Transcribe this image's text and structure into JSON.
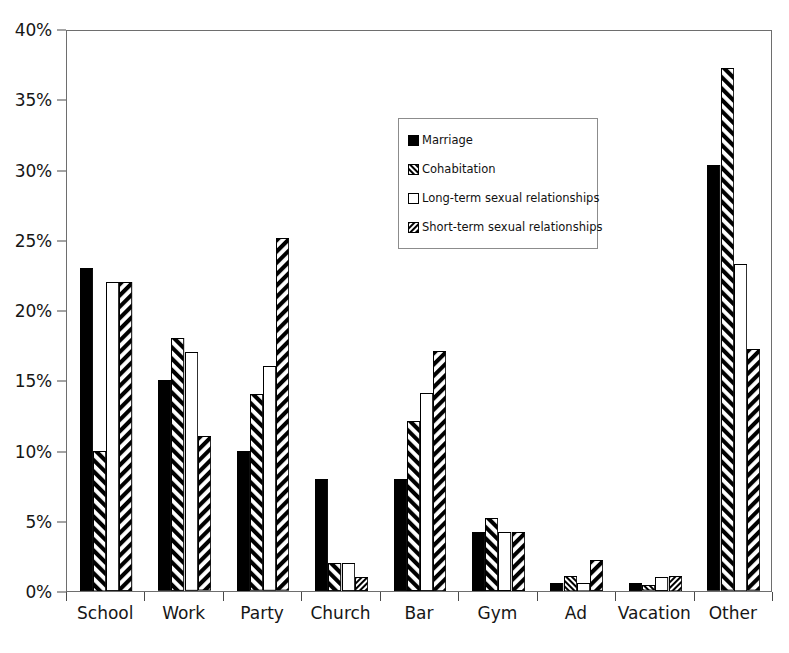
{
  "chart_data": {
    "type": "bar",
    "title": "",
    "subtitle": "",
    "xlabel": "",
    "ylabel": "",
    "ylim": [
      0,
      40
    ],
    "ytick_values": [
      0,
      5,
      10,
      15,
      20,
      25,
      30,
      35,
      40
    ],
    "ytick_labels": [
      "0%",
      "5%",
      "10%",
      "15%",
      "20%",
      "25%",
      "30%",
      "35%",
      "40%"
    ],
    "grid": false,
    "legend_position": "upper-center-right",
    "categories": [
      "School",
      "Work",
      "Party",
      "Church",
      "Bar",
      "Gym",
      "Ad",
      "Vacation",
      "Other"
    ],
    "series": [
      {
        "name": "Marriage",
        "fill": "solid-black",
        "color": "#000000",
        "values": [
          23,
          15,
          10,
          8,
          8,
          4.2,
          0.6,
          0.6,
          30.3
        ]
      },
      {
        "name": "Cohabitation",
        "fill": "hatch-forward",
        "color": "#000000",
        "values": [
          10,
          18,
          14,
          2,
          12.1,
          5.2,
          1.1,
          0.4,
          37.2
        ]
      },
      {
        "name": "Long-term sexual relationships",
        "fill": "empty-white",
        "color": "#ffffff",
        "values": [
          22,
          17,
          16,
          2,
          14.1,
          4.2,
          0.6,
          1,
          23.3
        ]
      },
      {
        "name": "Short-term sexual relationships",
        "fill": "hatch-backward",
        "color": "#000000",
        "values": [
          22,
          11,
          25.1,
          1,
          17.1,
          4.2,
          2.2,
          1.1,
          17.2
        ]
      }
    ]
  },
  "legend": {
    "items": [
      {
        "label": "Marriage",
        "swatch": "solid-black-swatch"
      },
      {
        "label": "Cohabitation",
        "swatch": "hatch-forward-swatch"
      },
      {
        "label": "Long-term sexual relationships",
        "swatch": "empty-white-swatch"
      },
      {
        "label": "Short-term sexual relationships",
        "swatch": "hatch-backward-swatch"
      }
    ]
  }
}
